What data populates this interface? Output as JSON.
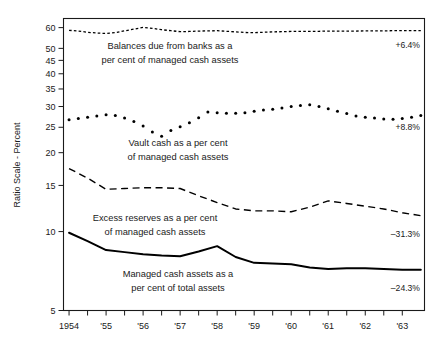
{
  "chart_data": {
    "type": "line",
    "title": "",
    "xlabel": "",
    "ylabel": "Ratio Scale - Percent",
    "scale": "log",
    "grid": false,
    "legend_position": "inline-annotations",
    "ylim": [
      5,
      65
    ],
    "yticks": [
      5,
      10,
      15,
      20,
      25,
      30,
      35,
      40,
      45,
      50,
      60
    ],
    "ytick_labels": [
      "5",
      "10",
      "15",
      "20",
      "25",
      "30",
      "35",
      "40",
      "45",
      "50",
      "60"
    ],
    "xticks": [
      1954,
      1955,
      1956,
      1957,
      1958,
      1959,
      1960,
      1961,
      1962,
      1963
    ],
    "xtick_labels": [
      "1954",
      "'55",
      "'56",
      "'57",
      "'58",
      "'59",
      "'60",
      "'61",
      "'62",
      "'63"
    ],
    "xlim": [
      1953.85,
      1963.6
    ],
    "series": [
      {
        "name": "Balances due from banks as a per cent of managed cash assets",
        "label_line1": "Balances due from banks as a",
        "label_line2": "per cent of managed cash assets",
        "style": "fine-dotted",
        "change_label": "+6.4%",
        "x": [
          1954.0,
          1954.25,
          1954.5,
          1954.75,
          1955.0,
          1955.25,
          1955.5,
          1955.75,
          1956.0,
          1956.25,
          1956.5,
          1956.75,
          1957.0,
          1957.25,
          1957.5,
          1957.75,
          1958.0,
          1958.25,
          1958.5,
          1958.75,
          1959.0,
          1959.25,
          1959.5,
          1959.75,
          1960.0,
          1960.25,
          1960.5,
          1960.75,
          1961.0,
          1961.25,
          1961.5,
          1961.75,
          1962.0,
          1962.25,
          1962.5,
          1962.75,
          1963.0,
          1963.25,
          1963.5
        ],
        "values": [
          58.6,
          58.2,
          57.6,
          57.2,
          57.0,
          57.4,
          58.3,
          59.2,
          60.1,
          59.6,
          58.9,
          58.4,
          57.9,
          58.0,
          58.2,
          58.3,
          58.4,
          58.1,
          57.8,
          57.5,
          57.4,
          57.6,
          57.8,
          57.9,
          58.0,
          58.0,
          58.1,
          58.1,
          58.2,
          58.2,
          58.2,
          58.2,
          58.3,
          58.3,
          58.3,
          58.4,
          58.4,
          58.4,
          58.4
        ]
      },
      {
        "name": "Vault cash as a per cent of managed cash assets",
        "label_line1": "Vault cash as a per cent",
        "label_line2": "of managed cash assets",
        "style": "round-dotted",
        "change_label": "+8.8%",
        "x": [
          1954.0,
          1954.25,
          1954.5,
          1954.75,
          1955.0,
          1955.25,
          1955.5,
          1955.75,
          1956.0,
          1956.25,
          1956.5,
          1956.75,
          1957.0,
          1957.25,
          1957.5,
          1957.75,
          1958.0,
          1958.25,
          1958.5,
          1958.75,
          1959.0,
          1959.25,
          1959.5,
          1959.75,
          1960.0,
          1960.25,
          1960.5,
          1960.75,
          1961.0,
          1961.25,
          1961.5,
          1961.75,
          1962.0,
          1962.25,
          1962.5,
          1962.75,
          1963.0,
          1963.25,
          1963.5
        ],
        "values": [
          26.7,
          27.0,
          27.3,
          27.6,
          27.9,
          27.7,
          27.1,
          26.3,
          25.3,
          24.0,
          23.1,
          24.3,
          25.1,
          26.0,
          27.2,
          28.6,
          28.4,
          28.3,
          28.3,
          28.4,
          28.8,
          29.1,
          29.3,
          29.6,
          30.0,
          30.3,
          30.5,
          30.0,
          29.4,
          28.8,
          28.2,
          27.6,
          27.3,
          27.1,
          26.9,
          26.8,
          27.0,
          27.3,
          27.7
        ]
      },
      {
        "name": "Excess reserves as a per cent of managed cash assets",
        "label_line1": "Excess reserves as a per cent",
        "label_line2": "of managed cash assets",
        "style": "dashed",
        "change_label": "–31.3%",
        "x": [
          1954.0,
          1954.5,
          1955.0,
          1955.5,
          1956.0,
          1956.5,
          1957.0,
          1957.5,
          1958.0,
          1958.5,
          1959.0,
          1959.5,
          1960.0,
          1960.5,
          1961.0,
          1961.5,
          1962.0,
          1962.5,
          1963.0,
          1963.5
        ],
        "values": [
          17.4,
          16.0,
          14.5,
          14.6,
          14.7,
          14.7,
          14.6,
          13.7,
          12.9,
          12.2,
          12.0,
          12.0,
          11.9,
          12.4,
          13.1,
          12.8,
          12.5,
          12.2,
          11.8,
          11.5
        ]
      },
      {
        "name": "Managed cash assets as a per cent of total assets",
        "label_line1": "Managed cash assets as a",
        "label_line2": "per cent of total assets",
        "style": "solid",
        "change_label": "–24.3%",
        "x": [
          1954.0,
          1954.5,
          1955.0,
          1955.5,
          1956.0,
          1956.5,
          1957.0,
          1957.5,
          1958.0,
          1958.5,
          1959.0,
          1959.5,
          1960.0,
          1960.5,
          1961.0,
          1961.5,
          1962.0,
          1962.5,
          1963.0,
          1963.5
        ],
        "values": [
          9.9,
          9.2,
          8.5,
          8.35,
          8.2,
          8.1,
          8.05,
          8.4,
          8.8,
          8.0,
          7.6,
          7.55,
          7.5,
          7.3,
          7.2,
          7.25,
          7.25,
          7.2,
          7.15,
          7.15
        ]
      }
    ]
  },
  "axis": {
    "ylabel_text": "Ratio Scale - Percent"
  }
}
